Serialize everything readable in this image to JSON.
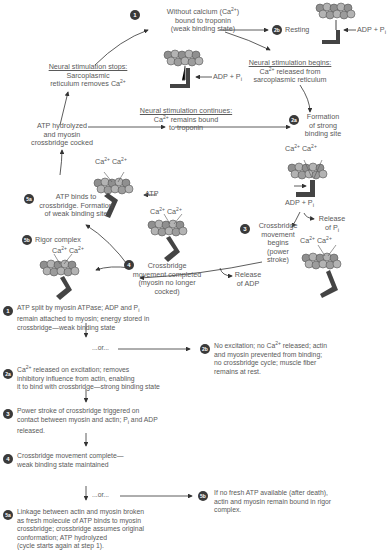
{
  "cycle": {
    "step1": {
      "badge": "1",
      "line1": "Without calcium (Ca",
      "sup": "2+",
      "line1_end": ")",
      "line2": "bound to troponin",
      "line3": "(weak binding state)",
      "adp": "ADP + P",
      "adp_sub": "i"
    },
    "step2b": {
      "badge": "2b",
      "label": "Resting",
      "adp": "ADP + P",
      "adp_sub": "i"
    },
    "neural_begins": {
      "title": "Neural stimulation begins:",
      "line1_pre": "Ca",
      "sup": "2+",
      "line1_post": " released from",
      "line2": "sarcoplasmic reticulum"
    },
    "neural_stops": {
      "title": "Neural stimulation stops:",
      "line1": "Sarcoplasmic",
      "line2_pre": "reticulum removes Ca",
      "sup": "2+"
    },
    "neural_continues": {
      "title": "Neural stimulation continues:",
      "line1_pre": "Ca",
      "sup": "2+",
      "line1_post": " remains bound",
      "line2": "to troponin"
    },
    "atp_hydrolyzed": {
      "line1": "ATP hydrolyzed",
      "line2": "and myosin",
      "line3": "crossbridge cocked"
    },
    "step2a": {
      "badge": "2a",
      "line1": "Formation",
      "line2": "of strong",
      "line3": "binding site",
      "ca_left": "Ca",
      "ca_right": "Ca",
      "sup": "2+",
      "adp": "ADP + P",
      "adp_sub": "i"
    },
    "release_pi": {
      "line1": "Release",
      "line2": "of P",
      "sub": "i"
    },
    "step3": {
      "badge": "3",
      "line1": "Crossbridge",
      "line2": "movement",
      "line3": "begins",
      "line4": "(power",
      "line5": "stroke)",
      "ca_left": "Ca",
      "ca_right": "Ca",
      "sup": "2+"
    },
    "step4": {
      "badge": "4",
      "line1": "Crossbridge",
      "line2": "movement completed",
      "line3": "(myosin no longer",
      "line4": "cocked)"
    },
    "release_adp": {
      "line1": "Release",
      "line2": "of ADP"
    },
    "step5a": {
      "badge": "5a",
      "line1": "ATP binds to",
      "line2": "crossbridge. Formation",
      "line3": "of weak binding site",
      "atp": "ATP",
      "ca_left": "Ca",
      "ca_right": "Ca",
      "sup": "2+"
    },
    "step5b": {
      "badge": "5b",
      "label": "Rigor complex",
      "ca_left": "Ca",
      "ca_right": "Ca",
      "sup": "2+"
    }
  },
  "flow": {
    "s1": {
      "badge": "1",
      "l1": "ATP split by myosin ATPase; ADP and P",
      "l1_sub": "i",
      "l2": "remain attached to myosin; energy stored in",
      "l3": "crossbridge—weak binding state"
    },
    "or1": "...or...",
    "s2a": {
      "badge": "2a",
      "l1_pre": "Ca",
      "sup": "2+",
      "l1_post": " released on excitation; removes",
      "l2": "inhibitory influence from actin, enabling",
      "l3": "it to bind with crossbridge—strong binding state"
    },
    "s2b": {
      "badge": "2b",
      "l1_pre": "No excitation; no Ca",
      "sup": "2+",
      "l1_post": " released; actin",
      "l2": "and myosin prevented from binding;",
      "l3": "no crossbridge cycle; muscle fiber",
      "l4": "remains at rest."
    },
    "s3": {
      "badge": "3",
      "l1": "Power stroke of crossbridge triggered on",
      "l2_pre": "contact between myosin and actin; P",
      "l2_sub": "i",
      "l2_post": " and ADP",
      "l3": "released."
    },
    "s4": {
      "badge": "4",
      "l1": "Crossbridge movement complete—",
      "l2": "weak binding state maintained"
    },
    "or2": "...or...",
    "s5a": {
      "badge": "5a",
      "l1": "Linkage between actin and myosin broken",
      "l2": "as fresh molecule of ATP binds to myosin",
      "l3": "crossbridge; crossbridge assumes original",
      "l4": "conformation; ATP hydrolyzed",
      "l5": "(cycle starts again at step 1)."
    },
    "s5b": {
      "badge": "5b",
      "l1": "If no fresh ATP available (after death),",
      "l2": "actin and myosin remain bound in rigor",
      "l3": "complex."
    }
  },
  "colors": {
    "badge": "#3a3a3a",
    "text": "#5a5a5a",
    "myosin": "#444444",
    "actin": "#9a9a9a",
    "arrow": "#333333"
  }
}
